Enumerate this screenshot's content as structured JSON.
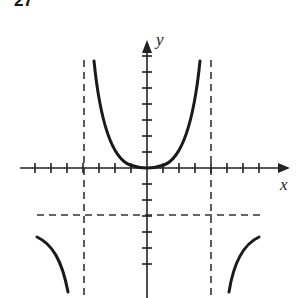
{
  "problem_number": "27",
  "axes": {
    "x_label": "x",
    "y_label": "y",
    "origin_px": [
      147,
      168
    ],
    "unit_px": 16,
    "x_ticks": [
      -7,
      -6,
      -5,
      -4,
      -3,
      -2,
      -1,
      1,
      2,
      3,
      4,
      5,
      6,
      7
    ],
    "y_ticks": [
      -6,
      -5,
      -4,
      -3,
      -2,
      -1,
      1,
      2,
      3,
      4,
      5,
      6,
      7
    ]
  },
  "asymptotes": {
    "vertical": [
      -4,
      4
    ],
    "horizontal": [
      -3
    ]
  },
  "curves": [
    {
      "name": "center-branch",
      "description": "U-shaped branch with minimum at origin, rising toward vertical asymptotes x=-4 and x=4"
    },
    {
      "name": "left-branch",
      "description": "Branch left of x=-4, below y=-3, descending toward x=-4"
    },
    {
      "name": "right-branch",
      "description": "Branch right of x=4, below y=-3, descending toward x=4"
    }
  ]
}
